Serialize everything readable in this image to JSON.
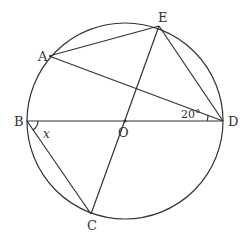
{
  "diagram": {
    "type": "geometry",
    "circle": {
      "center": "O",
      "cx": 125,
      "cy": 121,
      "r": 98
    },
    "points": {
      "A": {
        "x": 49,
        "y": 56,
        "label": "A"
      },
      "B": {
        "x": 27,
        "y": 121,
        "label": "B"
      },
      "C": {
        "x": 91,
        "y": 214,
        "label": "C"
      },
      "D": {
        "x": 223,
        "y": 121,
        "label": "D"
      },
      "E": {
        "x": 159,
        "y": 26,
        "label": "E"
      },
      "O": {
        "x": 125,
        "y": 121,
        "label": "O"
      }
    },
    "segments": [
      "AE",
      "AD",
      "ED",
      "BD",
      "EC",
      "BC"
    ],
    "angles": {
      "ADB": {
        "label": "20°"
      },
      "CBD": {
        "label": "x"
      }
    }
  }
}
